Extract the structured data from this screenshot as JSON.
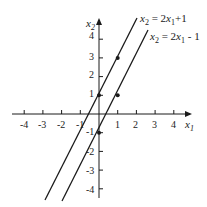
{
  "diagram": {
    "title": "",
    "axes": {
      "x_label": "x",
      "x_label_sub": "1",
      "y_label": "x",
      "y_label_sub": "2",
      "x_ticks": [
        "-4",
        "-3",
        "-2",
        "-1",
        "1",
        "2",
        "3",
        "4"
      ],
      "y_ticks": [
        "4",
        "3",
        "2",
        "1",
        "-1",
        "-2",
        "-3",
        "-4"
      ]
    },
    "lines": [
      {
        "name": "line-upper",
        "equation_lhs": "x",
        "equation_lhs_sub": "2",
        "equation_mid": " = 2",
        "equation_var": "x",
        "equation_var_sub": "1",
        "equation_rhs": "+1",
        "slope": 2,
        "intercept": 1,
        "marked_points": [
          [
            0,
            1
          ],
          [
            1,
            3
          ]
        ]
      },
      {
        "name": "line-lower",
        "equation_lhs": "x",
        "equation_lhs_sub": "2",
        "equation_mid": " = 2",
        "equation_var": "x",
        "equation_var_sub": "1",
        "equation_rhs": " - 1",
        "slope": 2,
        "intercept": -1,
        "marked_points": [
          [
            0,
            -1
          ],
          [
            1,
            1
          ]
        ]
      }
    ],
    "colors": {
      "ink": "#1a1a1a",
      "background": "#ffffff"
    }
  }
}
